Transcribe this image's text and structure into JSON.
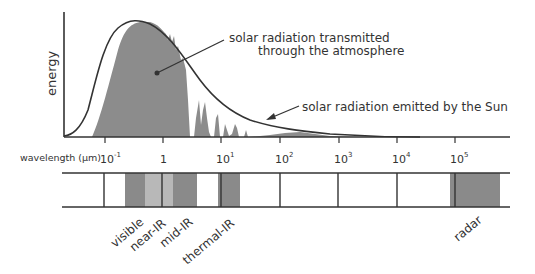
{
  "diagram": {
    "y_axis_label": "energy",
    "x_axis_label": "wavelength (µm)",
    "annotations": {
      "transmitted_line1": "solar radiation transmitted",
      "transmitted_line2": "through the atmosphere",
      "emitted": "solar radiation emitted by the Sun"
    },
    "ticks": [
      {
        "base": "10",
        "exp": "-1",
        "x": 105
      },
      {
        "base": "1",
        "exp": "",
        "x": 163
      },
      {
        "base": "10",
        "exp": "1",
        "x": 221
      },
      {
        "base": "10",
        "exp": "2",
        "x": 280
      },
      {
        "base": "10",
        "exp": "3",
        "x": 339
      },
      {
        "base": "10",
        "exp": "4",
        "x": 397
      },
      {
        "base": "10",
        "exp": "5",
        "x": 455
      }
    ],
    "bands": [
      {
        "name": "visible",
        "x1": 125,
        "x2": 145,
        "color": "#8a8a8a"
      },
      {
        "name": "near-IR",
        "x1": 145,
        "x2": 173,
        "color": "#b8b8b8"
      },
      {
        "name": "mid-IR",
        "x1": 173,
        "x2": 197,
        "color": "#8a8a8a"
      },
      {
        "name": "thermal-IR",
        "x1": 218,
        "x2": 240,
        "color": "#8a8a8a"
      },
      {
        "name": "radar",
        "x1": 450,
        "x2": 500,
        "color": "#8a8a8a"
      }
    ],
    "band_labels": {
      "visible": "visible",
      "near_ir": "near-IR",
      "mid_ir": "mid-IR",
      "thermal_ir": "thermal-IR",
      "radar": "radar"
    },
    "colors": {
      "transmitted_fill": "#8c8c8c",
      "line": "#333333",
      "dark_band": "#8a8a8a",
      "light_band": "#b8b8b8"
    }
  }
}
